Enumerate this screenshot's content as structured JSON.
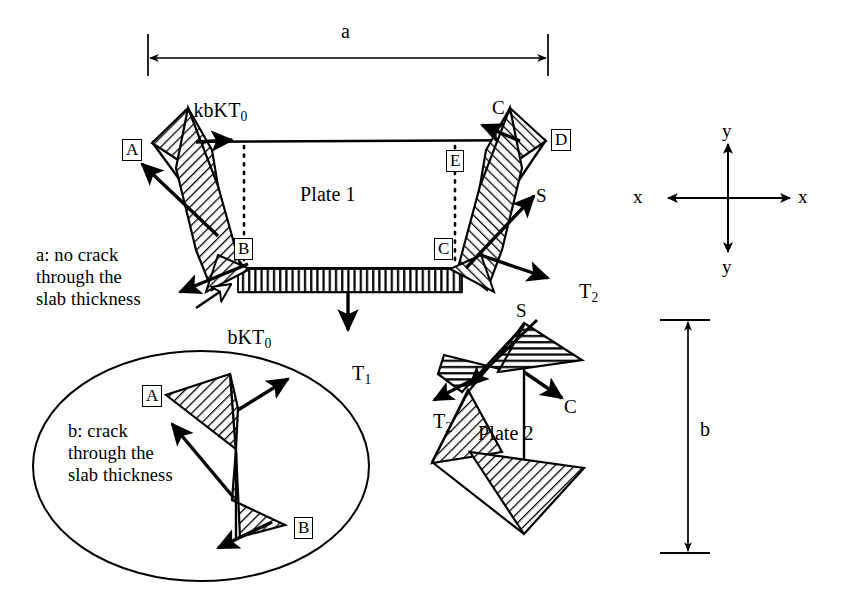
{
  "figure": {
    "background_color": "#ffffff",
    "line_color": "#000000",
    "hatch_color": "#000000",
    "width": 850,
    "height": 610
  },
  "dimensions": {
    "horizontal": {
      "label": "a",
      "orientation": "horizontal",
      "x_start": 148,
      "x_end": 548,
      "y": 58
    },
    "vertical": {
      "label": "b",
      "orientation": "vertical",
      "x": 688,
      "y_start": 320,
      "y_end": 553
    }
  },
  "axes": {
    "label_x_left": "x",
    "label_x_right": "x",
    "label_y_top": "y",
    "label_y_bottom": "y",
    "center_x": 728,
    "center_y": 198
  },
  "plate1": {
    "name": "Plate 1",
    "nodes": [
      {
        "id": "A",
        "boxed": true,
        "x": 124,
        "y": 140
      },
      {
        "id": "B",
        "boxed": true,
        "x": 237,
        "y": 240
      },
      {
        "id": "C",
        "boxed": true,
        "x": 436,
        "y": 240
      },
      {
        "id": "D",
        "boxed": true,
        "x": 553,
        "y": 131
      },
      {
        "id": "E",
        "boxed": true,
        "x": 456,
        "y": 152
      },
      {
        "id": "C",
        "boxed": false,
        "x": 496,
        "y": 100
      }
    ],
    "forces": [
      {
        "label": "kbKT",
        "sub": "0",
        "x": 175,
        "y": 79
      },
      {
        "label": "bKT",
        "sub": "0",
        "x": 210,
        "y": 305
      },
      {
        "label": "T",
        "sub": "1",
        "x": 333,
        "y": 339
      },
      {
        "label": "T",
        "sub": "2",
        "x": 563,
        "y": 256
      },
      {
        "label": "S",
        "sub": "",
        "x": 538,
        "y": 186
      },
      {
        "label": "C",
        "sub": "",
        "x": 496,
        "y": 100
      }
    ]
  },
  "plate2": {
    "name": "Plate 2",
    "forces": [
      {
        "label": "S",
        "sub": "",
        "x": 520,
        "y": 307
      },
      {
        "label": "T",
        "sub": "2",
        "x": 420,
        "y": 390
      },
      {
        "label": "C",
        "sub": "",
        "x": 568,
        "y": 400
      }
    ]
  },
  "captions": {
    "case_a": "a: no crack\nthrough the\nslab thickness",
    "case_a_x": 36,
    "case_a_y": 248,
    "case_b": "b: crack\nthrough the\nslab thickness",
    "case_b_x": 68,
    "case_b_y": 424
  },
  "inset": {
    "shape": "ellipse",
    "center_x": 201,
    "center_y": 466,
    "radius_x": 168,
    "radius_y": 115,
    "nodes": [
      {
        "id": "A",
        "boxed": true,
        "x": 144,
        "y": 387
      },
      {
        "id": "B",
        "boxed": true,
        "x": 296,
        "y": 519
      }
    ]
  }
}
